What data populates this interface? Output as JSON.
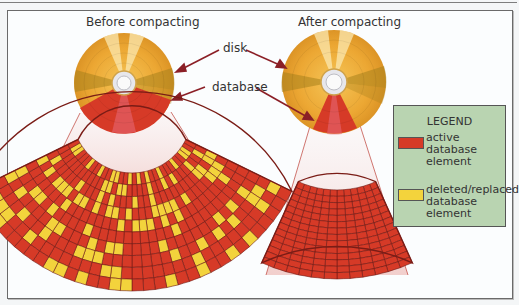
{
  "titles": {
    "before": "Before compacting",
    "after": "After compacting"
  },
  "callouts": {
    "disk": "disk",
    "database": "database"
  },
  "legend": {
    "title": "LEGEND",
    "items": [
      {
        "label": "active\ndatabase\nelement",
        "color": "#d63a27"
      },
      {
        "label": "deleted/replaced\ndatabase\nelement",
        "color": "#f3d33c"
      }
    ]
  },
  "colors": {
    "disk_gold": "#eaa22f",
    "disk_dark": "#b8871e",
    "active": "#d63a27",
    "deleted": "#f3d33c",
    "arrow": "#8b1f26",
    "legend_bg": "#b9d4b1"
  }
}
